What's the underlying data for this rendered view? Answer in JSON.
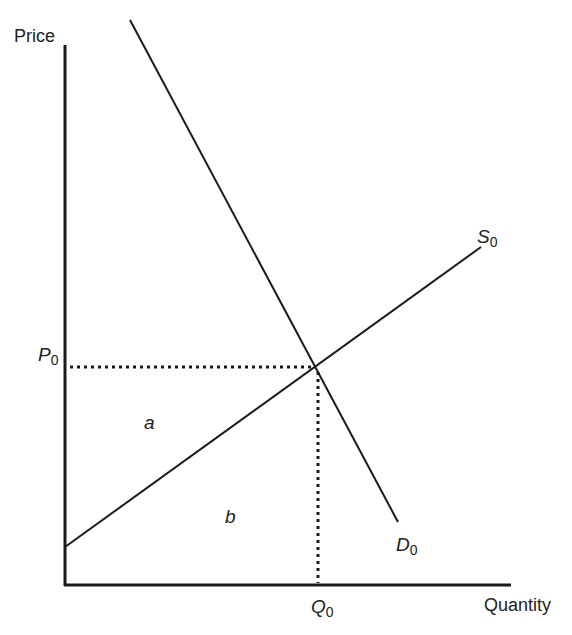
{
  "diagram": {
    "type": "supply-demand",
    "axes": {
      "y_label": "Price",
      "x_label": "Quantity"
    },
    "curves": {
      "supply": {
        "letter": "S",
        "subscript": "0"
      },
      "demand": {
        "letter": "D",
        "subscript": "0"
      }
    },
    "equilibrium": {
      "price": {
        "letter": "P",
        "subscript": "0"
      },
      "quantity": {
        "letter": "Q",
        "subscript": "0"
      }
    },
    "regions": {
      "a": "a",
      "b": "b"
    },
    "colors": {
      "line": "#1a1a1a",
      "text": "#222222",
      "background": "#ffffff"
    }
  }
}
